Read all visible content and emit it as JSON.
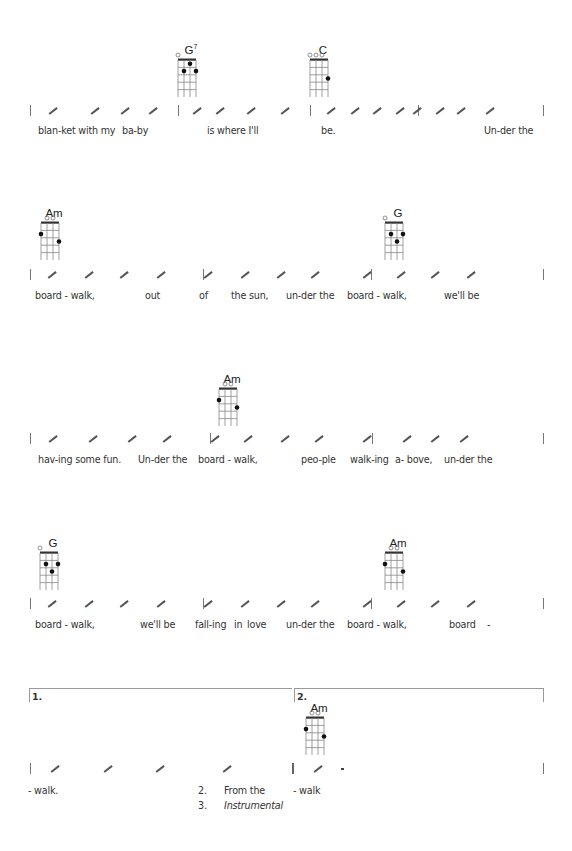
{
  "systems": [
    {
      "chords": [
        {
          "name": "G",
          "sup": "7",
          "x": 178,
          "y": 44,
          "open": [
            0
          ],
          "dots": [
            [
              2,
              1
            ],
            [
              1,
              2
            ],
            [
              3,
              2
            ]
          ]
        },
        {
          "name": "C",
          "sup": "",
          "x": 310,
          "y": 44,
          "open": [
            0,
            1,
            2
          ],
          "dots": [
            [
              3,
              3
            ]
          ]
        }
      ],
      "staff_y": 110,
      "bars": [
        30,
        178,
        310,
        418,
        543
      ],
      "slashes": [
        48,
        90,
        120,
        148,
        192,
        215,
        246,
        280,
        326,
        350,
        372,
        395,
        412,
        435,
        456,
        485
      ],
      "lyric_y": 125,
      "lyrics": [
        {
          "text": "blan-ket with my",
          "x": 38
        },
        {
          "text": "ba-by",
          "x": 122
        },
        {
          "text": "is where I'll",
          "x": 207
        },
        {
          "text": "be.",
          "x": 321
        },
        {
          "text": "Un-der the",
          "x": 484
        }
      ]
    },
    {
      "chords": [
        {
          "name": "Am",
          "sup": "",
          "x": 41,
          "y": 207,
          "open": [
            1,
            2
          ],
          "dots": [
            [
              0,
              2
            ],
            [
              3,
              3
            ]
          ]
        },
        {
          "name": "G",
          "sup": "",
          "x": 385,
          "y": 207,
          "open": [
            0
          ],
          "dots": [
            [
              1,
              2
            ],
            [
              3,
              2
            ],
            [
              2,
              3
            ]
          ]
        }
      ],
      "staff_y": 274,
      "bars": [
        30,
        203,
        371,
        543
      ],
      "slashes": [
        47,
        84,
        119,
        156,
        203,
        240,
        276,
        310,
        362,
        396,
        430,
        466
      ],
      "lyric_y": 290,
      "lyrics": [
        {
          "text": "board  -  walk,",
          "x": 35
        },
        {
          "text": "out",
          "x": 145
        },
        {
          "text": "of",
          "x": 199
        },
        {
          "text": "the sun,",
          "x": 231
        },
        {
          "text": "un-der the",
          "x": 286
        },
        {
          "text": "board  -  walk,",
          "x": 347
        },
        {
          "text": "we'll be",
          "x": 444
        }
      ]
    },
    {
      "chords": [
        {
          "name": "Am",
          "sup": "",
          "x": 219,
          "y": 373,
          "open": [
            1,
            2
          ],
          "dots": [
            [
              0,
              2
            ],
            [
              3,
              3
            ]
          ]
        }
      ],
      "staff_y": 438,
      "bars": [
        30,
        210,
        372,
        543
      ],
      "slashes": [
        48,
        88,
        127,
        162,
        210,
        243,
        280,
        314,
        362,
        402,
        430,
        459
      ],
      "lyric_y": 454,
      "lyrics": [
        {
          "text": "hav-ing some fun.",
          "x": 38
        },
        {
          "text": "Un-der the",
          "x": 138
        },
        {
          "text": "board  -  walk,",
          "x": 198
        },
        {
          "text": "peo-ple",
          "x": 301
        },
        {
          "text": "walk-ing",
          "x": 350
        },
        {
          "text": "a- bove,",
          "x": 395
        },
        {
          "text": "un-der the",
          "x": 444
        }
      ]
    },
    {
      "chords": [
        {
          "name": "G",
          "sup": "",
          "x": 40,
          "y": 537,
          "open": [
            0
          ],
          "dots": [
            [
              1,
              2
            ],
            [
              3,
              2
            ],
            [
              2,
              3
            ]
          ]
        },
        {
          "name": "Am",
          "sup": "",
          "x": 385,
          "y": 537,
          "open": [
            1,
            2
          ],
          "dots": [
            [
              0,
              2
            ],
            [
              3,
              3
            ]
          ]
        }
      ],
      "staff_y": 603,
      "bars": [
        30,
        203,
        371,
        543
      ],
      "slashes": [
        47,
        84,
        119,
        156,
        203,
        240,
        276,
        310,
        362,
        396,
        430,
        466
      ],
      "lyric_y": 619,
      "lyrics": [
        {
          "text": "board  -  walk,",
          "x": 35
        },
        {
          "text": "we'll be",
          "x": 140
        },
        {
          "text": "fall-ing",
          "x": 195
        },
        {
          "text": "in",
          "x": 234
        },
        {
          "text": "love",
          "x": 247
        },
        {
          "text": "un-der the",
          "x": 286
        },
        {
          "text": "board  -  walk,",
          "x": 347
        },
        {
          "text": "board",
          "x": 449
        },
        {
          "text": "-",
          "x": 487
        }
      ]
    }
  ],
  "endings": {
    "volta": [
      {
        "label": "1.",
        "x1": 29,
        "x2": 292
      },
      {
        "label": "2.",
        "x1": 294,
        "x2": 543
      }
    ],
    "volta_y": 688,
    "chords": [
      {
        "name": "Am",
        "sup": "",
        "x": 306,
        "y": 702,
        "open": [
          1,
          2
        ],
        "dots": [
          [
            0,
            2
          ],
          [
            3,
            3
          ]
        ]
      }
    ],
    "staff_y": 768,
    "bars": [
      30,
      543
    ],
    "repeat_bar_x": 292,
    "slashes": [
      50,
      103,
      155,
      222,
      313
    ],
    "rest_x": 341,
    "lyric_y": 785,
    "lyrics": [
      {
        "text": "- walk.",
        "x": 28,
        "italic": false
      },
      {
        "text": "2.",
        "x": 198,
        "italic": false
      },
      {
        "text": "From   the",
        "x": 224,
        "italic": false
      },
      {
        "text": "- walk",
        "x": 293,
        "italic": false
      },
      {
        "text": "3.",
        "x": 198,
        "italic": false,
        "dy": 15
      },
      {
        "text": "Instrumental",
        "x": 224,
        "italic": true,
        "dy": 15
      }
    ]
  },
  "colors": {
    "ink": "#222222",
    "staff": "#777777",
    "bracket": "#999999"
  }
}
